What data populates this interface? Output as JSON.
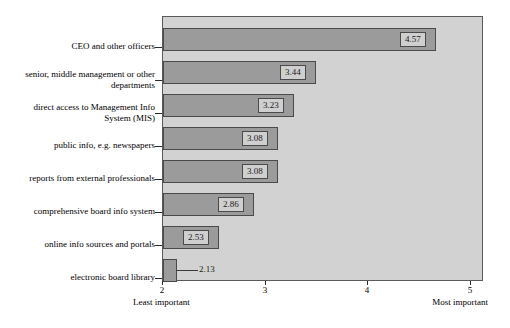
{
  "chart_data": {
    "type": "bar",
    "orientation": "horizontal",
    "title": "",
    "xlabel": "",
    "ylabel": "",
    "xlim": [
      2,
      5
    ],
    "xticks": [
      2,
      3,
      4,
      5
    ],
    "xtick_labels": [
      "2",
      "3",
      "4",
      "5"
    ],
    "grid": false,
    "legend": null,
    "axis_low_label": "Least important",
    "axis_high_label": "Most important",
    "categories": [
      "CEO and other officers",
      "senior, middle management or other\ndepartments",
      "direct access to Management Info\nSystem (MIS)",
      "public info, e.g. newspapers",
      "reports from external professionals",
      "comprehensive board info system",
      "online info sources and portals",
      "electronic board library"
    ],
    "values": [
      4.57,
      3.44,
      3.23,
      3.08,
      3.08,
      2.86,
      2.53,
      2.13
    ],
    "value_labels": [
      "4.57",
      "3.44",
      "3.23",
      "3.08",
      "3.08",
      "2.86",
      "2.53",
      "2.13"
    ]
  },
  "colors": {
    "bar_fill": "#9b9b9b",
    "bar_border": "#4a4a4a",
    "panel_background": "#d2d2d2",
    "panel_border": "#5a5a5a",
    "label_box_fill": "#cfcfcf",
    "text": "#000000"
  }
}
